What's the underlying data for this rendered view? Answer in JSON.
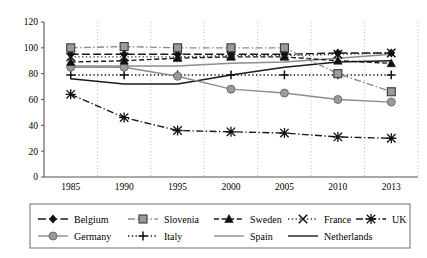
{
  "chart_data": {
    "type": "line",
    "title": "",
    "xlabel": "",
    "ylabel": "",
    "x": [
      1985,
      1990,
      1995,
      2000,
      2005,
      2010,
      2013
    ],
    "xtick_labels": [
      "1985",
      "1990",
      "1995",
      "2000",
      "2005",
      "2010",
      "2013"
    ],
    "ylim": [
      0,
      120
    ],
    "ytick_labels": [
      "0",
      "20",
      "40",
      "60",
      "80",
      "100",
      "120"
    ],
    "yticks": [
      0,
      20,
      40,
      60,
      80,
      100,
      120
    ],
    "grid": "vertical-dotted",
    "legend_position": "bottom",
    "series": [
      {
        "name": "Belgium",
        "marker": "diamond",
        "dash": "dashed-long",
        "color": "#1a1a1a",
        "values": [
          95,
          95,
          95,
          95,
          95,
          96,
          96
        ]
      },
      {
        "name": "Slovenia",
        "marker": "square",
        "dash": "dash-dot",
        "color": "#8c8c8c",
        "values": [
          100,
          101,
          100,
          100,
          100,
          80,
          66
        ]
      },
      {
        "name": "Sweden",
        "marker": "triangle",
        "dash": "dashed",
        "color": "#1a1a1a",
        "values": [
          89,
          90,
          92,
          93,
          93,
          90,
          88
        ]
      },
      {
        "name": "France",
        "marker": "cross-x",
        "dash": "dotted",
        "color": "#3a3a3a",
        "values": [
          93,
          93,
          93,
          94,
          94,
          95,
          96
        ]
      },
      {
        "name": "UK",
        "marker": "asterisk",
        "dash": "dash-dot",
        "color": "#1a1a1a",
        "values": [
          64,
          46,
          36,
          35,
          34,
          31,
          30
        ]
      },
      {
        "name": "Germany",
        "marker": "circle",
        "dash": "solid",
        "color": "#8c8c8c",
        "values": [
          85,
          85,
          78,
          68,
          65,
          60,
          58
        ]
      },
      {
        "name": "Italy",
        "marker": "plus",
        "dash": "dotted",
        "color": "#1a1a1a",
        "values": [
          79,
          79,
          79,
          79,
          79,
          79,
          79
        ]
      },
      {
        "name": "Spain",
        "marker": "none",
        "dash": "solid",
        "color": "#8c8c8c",
        "values": [
          86,
          86,
          86,
          88,
          89,
          92,
          95
        ]
      },
      {
        "name": "Netherlands",
        "marker": "none",
        "dash": "solid",
        "color": "#1a1a1a",
        "values": [
          76,
          72,
          72,
          79,
          85,
          89,
          90
        ]
      }
    ]
  },
  "legend": {
    "rows": [
      [
        {
          "label": "Belgium",
          "key": "belgium"
        },
        {
          "label": "Slovenia",
          "key": "slovenia"
        },
        {
          "label": "Sweden",
          "key": "sweden"
        },
        {
          "label": "France",
          "key": "france"
        },
        {
          "label": "UK",
          "key": "uk"
        }
      ],
      [
        {
          "label": "Germany",
          "key": "germany"
        },
        {
          "label": "Italy",
          "key": "italy"
        },
        {
          "label": "Spain",
          "key": "spain"
        },
        {
          "label": "Netherlands",
          "key": "netherlands"
        }
      ]
    ]
  }
}
